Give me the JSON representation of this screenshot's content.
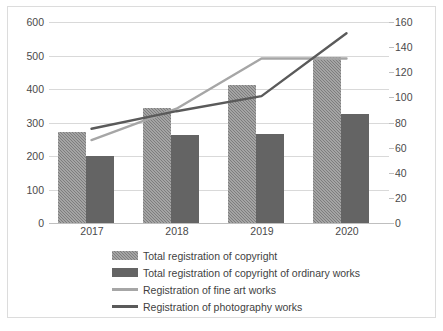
{
  "chart_data": {
    "type": "bar",
    "title": "",
    "subtitle": "",
    "xlabel": "",
    "ylabel": "",
    "y2label": "",
    "categories": [
      "2017",
      "2018",
      "2019",
      "2020"
    ],
    "grid": true,
    "legend_position": "bottom",
    "axes": {
      "left": {
        "min": 0,
        "max": 600,
        "step": 100,
        "ticks": [
          "0",
          "100",
          "200",
          "300",
          "400",
          "500",
          "600"
        ]
      },
      "right": {
        "min": 0,
        "max": 160,
        "step": 20,
        "ticks": [
          "0",
          "20",
          "40",
          "60",
          "80",
          "100",
          "120",
          "140",
          "160"
        ]
      }
    },
    "series": [
      {
        "name": "Total registration of copyright",
        "kind": "bar",
        "axis": "left",
        "color": "#7d7d7d",
        "values": [
          273,
          342,
          412,
          497
        ]
      },
      {
        "name": "Total registration of copyright of ordinary works",
        "kind": "bar",
        "axis": "left",
        "color": "#646464",
        "values": [
          199,
          262,
          266,
          325
        ]
      },
      {
        "name": "Registration of fine art works",
        "kind": "line",
        "axis": "right",
        "color": "#a6a6a6",
        "values": [
          66,
          91,
          131,
          131
        ]
      },
      {
        "name": "Registration of photography works",
        "kind": "line",
        "axis": "right",
        "color": "#5a5a5a",
        "values": [
          75,
          89,
          101,
          151
        ]
      }
    ]
  },
  "legend": {
    "items": [
      {
        "label": "Total registration of copyright"
      },
      {
        "label": "Total registration of copyright of ordinary works"
      },
      {
        "label": "Registration of fine art works"
      },
      {
        "label": "Registration of photography works"
      }
    ]
  }
}
